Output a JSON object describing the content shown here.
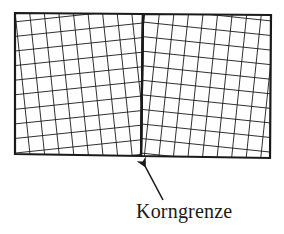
{
  "figure": {
    "label": "Korngrenze",
    "colors": {
      "line": "#1a1a1a",
      "background": "#ffffff"
    },
    "grains": [
      {
        "name": "left-grain",
        "rotation_deg": -6,
        "spacing_px": 14.5
      },
      {
        "name": "right-grain",
        "rotation_deg": 6,
        "spacing_px": 14.5
      }
    ]
  }
}
